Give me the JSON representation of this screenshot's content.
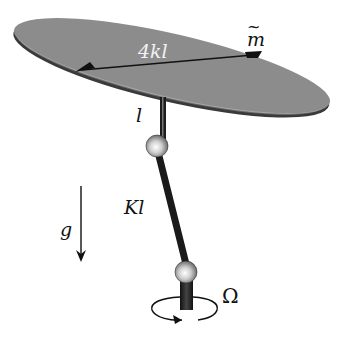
{
  "figure": {
    "labels": {
      "diameter": "4kl",
      "mass": "m",
      "mass_tilde": "~",
      "upper_rod": "l",
      "lower_rod": "Kl",
      "gravity": "g",
      "rotation": "Ω"
    },
    "colors": {
      "disk_fill": "#8c8c8c",
      "disk_edge": "#3a3a3a",
      "rod": "#222222",
      "ball": "#d8d8d8",
      "line": "#111111",
      "background": "#ffffff"
    }
  }
}
